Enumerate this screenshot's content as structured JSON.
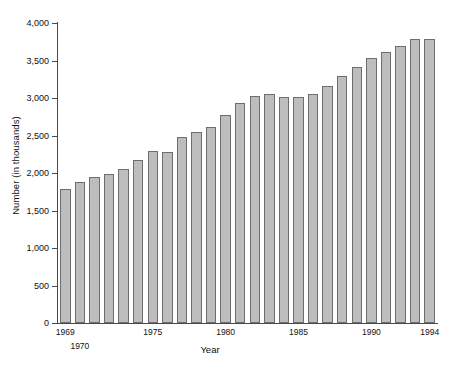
{
  "chart_data": {
    "type": "bar",
    "title": "",
    "xlabel": "Year",
    "ylabel": "Number (in thousands)",
    "ylim": [
      0,
      4000
    ],
    "yticks": [
      0,
      500,
      1000,
      1500,
      2000,
      2500,
      3000,
      3500,
      4000
    ],
    "ytick_labels": [
      "0",
      "500",
      "1,000",
      "1,500",
      "2,000",
      "2,500",
      "3,000",
      "3,500",
      "4,000"
    ],
    "grid": false,
    "legend": "none",
    "bar_color": "#bdbdbd",
    "bar_border_color": "#6e6e6e",
    "axis_color": "#4a4a4a",
    "categories": [
      "1969",
      "1970",
      "1971",
      "1972",
      "1973",
      "1974",
      "1975",
      "1976",
      "1977",
      "1978",
      "1979",
      "1980",
      "1981",
      "1982",
      "1983",
      "1984",
      "1985",
      "1986",
      "1987",
      "1988",
      "1989",
      "1990",
      "1991",
      "1992",
      "1993",
      "1994"
    ],
    "values": [
      1790,
      1880,
      1950,
      1990,
      2060,
      2170,
      2290,
      2280,
      2480,
      2550,
      2620,
      2770,
      2930,
      3030,
      3060,
      3010,
      3010,
      3060,
      3160,
      3300,
      3410,
      3540,
      3620,
      3700,
      3790,
      3790
    ],
    "xtick_labels": [
      {
        "text": "1969",
        "category": "1969",
        "row": 1
      },
      {
        "text": "1970",
        "category": "1970",
        "row": 2
      },
      {
        "text": "1975",
        "category": "1975",
        "row": 1
      },
      {
        "text": "1980",
        "category": "1980",
        "row": 1
      },
      {
        "text": "1985",
        "category": "1985",
        "row": 1
      },
      {
        "text": "1990",
        "category": "1990",
        "row": 1
      },
      {
        "text": "1994",
        "category": "1994",
        "row": 1
      }
    ]
  }
}
